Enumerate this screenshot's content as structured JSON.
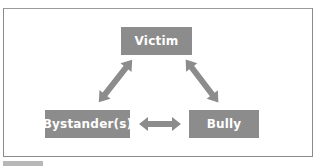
{
  "diagram": {
    "type": "relationship-triangle",
    "colors": {
      "node_fill": "#8c8c8c",
      "node_text": "#ffffff",
      "arrow_fill": "#8c8c8c",
      "frame_border": "#8a8a8a"
    },
    "nodes": [
      {
        "id": "victim",
        "label": "Victim"
      },
      {
        "id": "bystander",
        "label": "Bystander(s)"
      },
      {
        "id": "bully",
        "label": "Bully"
      }
    ],
    "edges": [
      {
        "from": "victim",
        "to": "bystander",
        "direction": "bidirectional"
      },
      {
        "from": "victim",
        "to": "bully",
        "direction": "bidirectional"
      },
      {
        "from": "bystander",
        "to": "bully",
        "direction": "bidirectional"
      }
    ]
  }
}
